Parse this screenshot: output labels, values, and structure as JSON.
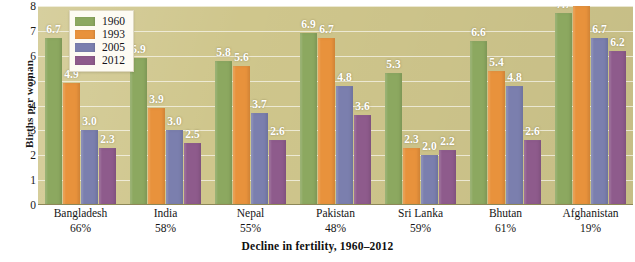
{
  "chart_data": {
    "type": "bar",
    "title": "",
    "xlabel": "Decline in fertility, 1960–2012",
    "ylabel": "Births per woman",
    "ylim": [
      0,
      8
    ],
    "yticks": [
      "0",
      "1",
      "2",
      "3",
      "4",
      "5",
      "6",
      "7",
      "8"
    ],
    "grid": true,
    "legend_position": "top-left",
    "categories": [
      "Bangladesh",
      "India",
      "Nepal",
      "Pakistan",
      "Sri Lanka",
      "Bhutan",
      "Afghanistan"
    ],
    "category_sublabels": [
      "66%",
      "58%",
      "55%",
      "48%",
      "59%",
      "61%",
      "19%"
    ],
    "series": [
      {
        "name": "1960",
        "color": "#8ca860",
        "values": [
          6.7,
          5.9,
          5.8,
          6.9,
          5.3,
          6.6,
          7.7
        ]
      },
      {
        "name": "1993",
        "color": "#e8923c",
        "values": [
          4.9,
          3.9,
          5.6,
          6.7,
          2.3,
          5.4,
          8.0
        ]
      },
      {
        "name": "2005",
        "color": "#7b7fae",
        "values": [
          3.0,
          3.0,
          3.7,
          4.8,
          2.0,
          4.8,
          6.7
        ]
      },
      {
        "name": "2012",
        "color": "#8e5b8c",
        "values": [
          2.3,
          2.5,
          2.6,
          3.6,
          2.2,
          2.6,
          6.2
        ]
      }
    ],
    "value_labels": [
      [
        "6.7",
        "4.9",
        "3.0",
        "2.3"
      ],
      [
        "5.9",
        "3.9",
        "3.0",
        "2.5"
      ],
      [
        "5.8",
        "5.6",
        "3.7",
        "2.6"
      ],
      [
        "6.9",
        "6.7",
        "4.8",
        "3.6"
      ],
      [
        "5.3",
        "2.3",
        "2.0",
        "2.2"
      ],
      [
        "6.6",
        "5.4",
        "4.8",
        "2.6"
      ],
      [
        "7.7",
        "8.0",
        "6.7",
        "6.2"
      ]
    ],
    "plot_background_color": "#cfc68c",
    "value_label_color": "#ffffff"
  }
}
